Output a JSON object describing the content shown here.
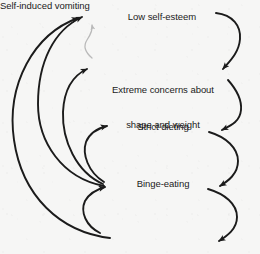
{
  "diagram": {
    "type": "cycle-flow-diagram",
    "background_color": "#f6f6f5",
    "ink_color": "#1b1b1b",
    "faint_ink_color": "#b9b9b9",
    "nodes": [
      {
        "id": "low-self-esteem",
        "label": "Low self-esteem"
      },
      {
        "id": "extreme-concerns",
        "label_line1": "Extreme concerns about",
        "label_line2": "shape and weight"
      },
      {
        "id": "strict-dieting",
        "label": "Strict dieting"
      },
      {
        "id": "binge-eating",
        "label": "Binge-eating"
      },
      {
        "id": "self-induced-vomiting",
        "label": "Self-induced vomiting"
      }
    ],
    "edges": [
      {
        "id": "edge-lse-to-concerns",
        "from": "low-self-esteem",
        "to": "extreme-concerns",
        "side": "right",
        "style": "solid"
      },
      {
        "id": "edge-concerns-to-dieting",
        "from": "extreme-concerns",
        "to": "strict-dieting",
        "side": "right",
        "style": "solid"
      },
      {
        "id": "edge-dieting-to-binge",
        "from": "strict-dieting",
        "to": "binge-eating",
        "side": "right",
        "style": "solid"
      },
      {
        "id": "edge-binge-to-vomiting",
        "from": "binge-eating",
        "to": "self-induced-vomiting",
        "side": "right",
        "style": "solid"
      },
      {
        "id": "edge-binge-to-lse",
        "from": "binge-eating",
        "to": "low-self-esteem",
        "side": "left",
        "style": "solid"
      },
      {
        "id": "edge-vomiting-to-lse",
        "from": "self-induced-vomiting",
        "to": "low-self-esteem",
        "side": "left",
        "style": "solid"
      },
      {
        "id": "edge-binge-to-concerns",
        "from": "binge-eating",
        "to": "extreme-concerns",
        "side": "left",
        "style": "solid"
      },
      {
        "id": "edge-binge-to-dieting",
        "from": "binge-eating",
        "to": "strict-dieting",
        "side": "left",
        "style": "solid"
      },
      {
        "id": "edge-vomiting-to-binge",
        "from": "self-induced-vomiting",
        "to": "binge-eating",
        "side": "left",
        "style": "solid"
      },
      {
        "id": "edge-concerns-to-lse-faint",
        "from": "extreme-concerns",
        "to": "low-self-esteem",
        "side": "center",
        "style": "faint"
      }
    ]
  }
}
